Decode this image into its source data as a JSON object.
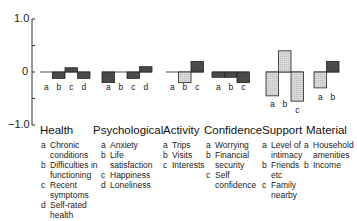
{
  "axis": {
    "y_top_label": "1.0",
    "y_zero_label": "0",
    "y_bottom_label": "−1.0"
  },
  "colors": {
    "dark_bar": "#4a4a4a",
    "light_bar": "#d9d9d9",
    "axis": "#333333"
  },
  "groups": [
    {
      "title": "Health",
      "legend": [
        {
          "key": "a",
          "text": "Chronic\nconditions"
        },
        {
          "key": "b",
          "text": "Difficulties in\nfunctioning"
        },
        {
          "key": "c",
          "text": "Recent\nsymptoms"
        },
        {
          "key": "d",
          "text": "Self-rated\nhealth"
        }
      ]
    },
    {
      "title": "Psychological",
      "legend": [
        {
          "key": "a",
          "text": "Anxiety"
        },
        {
          "key": "b",
          "text": "Life\nsatisfaction"
        },
        {
          "key": "c",
          "text": "Happiness"
        },
        {
          "key": "d",
          "text": "Loneliness"
        }
      ]
    },
    {
      "title": "Activity",
      "legend": [
        {
          "key": "a",
          "text": "Trips"
        },
        {
          "key": "b",
          "text": "Visits"
        },
        {
          "key": "c",
          "text": "Interests"
        }
      ]
    },
    {
      "title": "Confidence",
      "legend": [
        {
          "key": "a",
          "text": "Worrying"
        },
        {
          "key": "b",
          "text": "Financial\nsecurity"
        },
        {
          "key": "c",
          "text": "Self\nconfidence"
        }
      ]
    },
    {
      "title": "Support",
      "legend": [
        {
          "key": "a",
          "text": "Level of\nintimacy"
        },
        {
          "key": "b",
          "text": "Friends\netc"
        },
        {
          "key": "c",
          "text": "Family\nnearby"
        }
      ]
    },
    {
      "title": "Material",
      "legend": [
        {
          "key": "a",
          "text": "Household\namenities"
        },
        {
          "key": "b",
          "text": "Income"
        }
      ]
    }
  ],
  "chart_data": {
    "type": "bar",
    "title": "",
    "xlabel": "",
    "ylabel": "",
    "ylim": [
      -1.0,
      1.0
    ],
    "yticks": [
      -1.0,
      -0.5,
      0,
      0.5,
      1.0
    ],
    "ytick_labels": [
      "−1.0",
      "",
      "0",
      "",
      "1.0"
    ],
    "grid": false,
    "legend_position": "below, per group",
    "groups": [
      {
        "name": "Health",
        "categories": [
          "a",
          "b",
          "c",
          "d"
        ],
        "labels": [
          "Chronic conditions",
          "Difficulties in functioning",
          "Recent symptoms",
          "Self-rated health"
        ],
        "values": [
          0.0,
          -0.12,
          0.08,
          -0.12
        ],
        "shading": [
          "dark",
          "dark",
          "dark",
          "dark"
        ]
      },
      {
        "name": "Psychological",
        "categories": [
          "a",
          "b",
          "c",
          "d"
        ],
        "labels": [
          "Anxiety",
          "Life satisfaction",
          "Happiness",
          "Loneliness"
        ],
        "values": [
          -0.2,
          0.0,
          -0.12,
          0.1
        ],
        "shading": [
          "dark",
          "dark",
          "dark",
          "dark"
        ]
      },
      {
        "name": "Activity",
        "categories": [
          "a",
          "b",
          "c"
        ],
        "labels": [
          "Trips",
          "Visits",
          "Interests"
        ],
        "values": [
          0.0,
          -0.2,
          0.2
        ],
        "shading": [
          "light",
          "light",
          "dark"
        ]
      },
      {
        "name": "Confidence",
        "categories": [
          "a",
          "b",
          "c"
        ],
        "labels": [
          "Worrying",
          "Financial security",
          "Self confidence"
        ],
        "values": [
          -0.1,
          -0.1,
          -0.2
        ],
        "shading": [
          "dark",
          "dark",
          "dark"
        ]
      },
      {
        "name": "Support",
        "categories": [
          "a",
          "b",
          "c"
        ],
        "labels": [
          "Level of intimacy",
          "Friends etc",
          "Family nearby"
        ],
        "values": [
          -0.45,
          0.4,
          -0.55
        ],
        "shading": [
          "light",
          "light",
          "light"
        ]
      },
      {
        "name": "Material",
        "categories": [
          "a",
          "b"
        ],
        "labels": [
          "Household amenities",
          "Income"
        ],
        "values": [
          -0.3,
          0.2
        ],
        "shading": [
          "light",
          "dark"
        ]
      }
    ]
  }
}
